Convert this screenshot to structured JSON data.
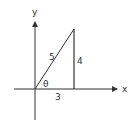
{
  "diagram": {
    "type": "right-triangle-on-axes",
    "axes": {
      "x_label": "x",
      "y_label": "y"
    },
    "triangle": {
      "hypotenuse_label": "5",
      "opposite_label": "4",
      "adjacent_label": "3",
      "angle_label": "θ"
    },
    "colors": {
      "stroke": "#333333",
      "background": "#ffffff"
    }
  }
}
